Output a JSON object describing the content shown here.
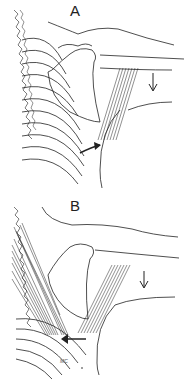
{
  "figure": {
    "panels": [
      {
        "id": "A",
        "label": "A",
        "arrows": [
          "downward arrow at arm (right)",
          "curved arrow pointing up-right at lower muscle insertion"
        ]
      },
      {
        "id": "B",
        "label": "B",
        "arrows": [
          "downward arrow at arm (right)",
          "leftward arrow at lower muscle insertion"
        ]
      }
    ],
    "signature": "MC",
    "colors": {
      "line": "#222222",
      "background": "#ffffff"
    }
  }
}
